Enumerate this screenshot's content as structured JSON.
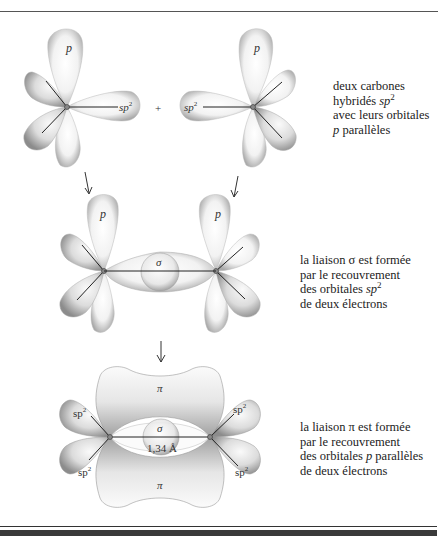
{
  "figure": {
    "step1": {
      "left_atom": {
        "p_label": "p",
        "sp2_label": "sp",
        "sp2_sup": "2"
      },
      "plus_sign": "+",
      "right_atom": {
        "p_label": "p",
        "sp2_label": "sp",
        "sp2_sup": "2"
      },
      "caption": {
        "line1": "deux carbones",
        "line2_text": "hybridés ",
        "line2_italic": "sp",
        "line2_sup": "2",
        "line3": "avec leurs orbitales",
        "line4_italic": "p",
        "line4_text": " parallèles"
      }
    },
    "step2": {
      "left_atom": {
        "p_label": "p"
      },
      "right_atom": {
        "p_label": "p"
      },
      "sigma_label": "σ",
      "caption": {
        "line1": "la liaison σ est formée",
        "line2": "par le recouvrement",
        "line3_text": "des orbitales ",
        "line3_italic": "sp",
        "line3_sup": "2",
        "line4": "de deux électrons"
      }
    },
    "step3": {
      "pi_top_label": "π",
      "pi_bottom_label": "π",
      "sigma_label": "σ",
      "bond_length": "1,34 Å",
      "sp2_labels": [
        "sp",
        "sp",
        "sp",
        "sp"
      ],
      "sp2_sup": "2",
      "caption": {
        "line1": "la liaison π est formée",
        "line2": "par le recouvrement",
        "line3_text": "des orbitales ",
        "line3_italic": "p",
        "line3_text2": " parallèles",
        "line4": "de deux électrons"
      }
    },
    "arrows": [
      "↓",
      "↓",
      "↓"
    ]
  }
}
